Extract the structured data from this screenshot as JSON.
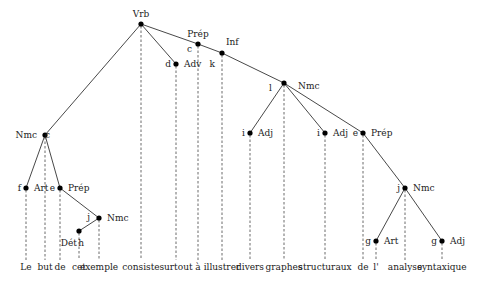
{
  "diagram": {
    "type": "dependency-tree",
    "word_baseline_y": 270,
    "nodes": [
      {
        "id": "vrb",
        "label": "Vrb",
        "tag": "",
        "x": 141,
        "y": 24,
        "label_pos": "top",
        "word": "consiste"
      },
      {
        "id": "adv",
        "label": "Adv",
        "tag": "d",
        "x": 176,
        "y": 64,
        "label_pos": "right",
        "word": "surtout"
      },
      {
        "id": "prep1",
        "label": "Prép",
        "tag": "c",
        "x": 198,
        "y": 44,
        "label_pos": "top",
        "word": "à"
      },
      {
        "id": "inf",
        "label": "Inf",
        "tag": "k",
        "x": 222,
        "y": 53,
        "label_pos": "topright",
        "word": "illustrer"
      },
      {
        "id": "nmc1",
        "label": "Nmc",
        "tag": "l",
        "x": 284,
        "y": 83,
        "label_pos": "right",
        "word": "graphes"
      },
      {
        "id": "adj1",
        "label": "Adj",
        "tag": "i",
        "x": 250,
        "y": 133,
        "label_pos": "right",
        "word": "divers"
      },
      {
        "id": "adj2",
        "label": "Adj",
        "tag": "i",
        "x": 325,
        "y": 133,
        "label_pos": "right",
        "word": "structuraux"
      },
      {
        "id": "prep2",
        "label": "Prép",
        "tag": "e",
        "x": 363,
        "y": 133,
        "label_pos": "right",
        "word": "de"
      },
      {
        "id": "nmc2",
        "label": "Nmc",
        "tag": "j",
        "x": 405,
        "y": 188,
        "label_pos": "right",
        "word": "analyse"
      },
      {
        "id": "art2",
        "label": "Art",
        "tag": "g",
        "x": 376,
        "y": 241,
        "label_pos": "right",
        "word": "l'"
      },
      {
        "id": "adj3",
        "label": "Adj",
        "tag": "g",
        "x": 442,
        "y": 241,
        "label_pos": "right",
        "word": "syntaxique"
      },
      {
        "id": "nmc0",
        "label": "Nmc",
        "tag": "c",
        "x": 45,
        "y": 135,
        "label_pos": "left",
        "word": "but"
      },
      {
        "id": "art1",
        "label": "Art",
        "tag": "f",
        "x": 26,
        "y": 188,
        "label_pos": "right",
        "word": "Le"
      },
      {
        "id": "prep0",
        "label": "Prép",
        "tag": "e",
        "x": 60,
        "y": 188,
        "label_pos": "right",
        "word": "de"
      },
      {
        "id": "nmc3",
        "label": "Nmc",
        "tag": "j",
        "x": 99,
        "y": 218,
        "label_pos": "right",
        "word": "exemple"
      },
      {
        "id": "det",
        "label": "Dét",
        "tag": "h",
        "x": 79,
        "y": 231,
        "label_pos": "below",
        "word": "cet"
      }
    ],
    "edges": [
      [
        "vrb",
        "nmc0"
      ],
      [
        "vrb",
        "adv"
      ],
      [
        "vrb",
        "prep1"
      ],
      [
        "prep1",
        "inf"
      ],
      [
        "inf",
        "nmc1"
      ],
      [
        "nmc1",
        "adj1"
      ],
      [
        "nmc1",
        "adj2"
      ],
      [
        "nmc1",
        "prep2"
      ],
      [
        "prep2",
        "nmc2"
      ],
      [
        "nmc2",
        "art2"
      ],
      [
        "nmc2",
        "adj3"
      ],
      [
        "nmc0",
        "art1"
      ],
      [
        "nmc0",
        "prep0"
      ],
      [
        "prep0",
        "nmc3"
      ],
      [
        "nmc3",
        "det"
      ]
    ],
    "words": [
      {
        "text": "Le",
        "x": 26
      },
      {
        "text": "but",
        "x": 45
      },
      {
        "text": "de",
        "x": 60
      },
      {
        "text": "cet",
        "x": 79
      },
      {
        "text": "exemple",
        "x": 99
      },
      {
        "text": "consiste",
        "x": 141
      },
      {
        "text": "surtout",
        "x": 176
      },
      {
        "text": "à",
        "x": 198
      },
      {
        "text": "illustrer",
        "x": 222
      },
      {
        "text": "divers",
        "x": 250
      },
      {
        "text": "graphes",
        "x": 284
      },
      {
        "text": "structuraux",
        "x": 325
      },
      {
        "text": "de",
        "x": 363
      },
      {
        "text": "l'",
        "x": 376
      },
      {
        "text": "analyse",
        "x": 405
      },
      {
        "text": "syntaxique",
        "x": 442
      }
    ]
  }
}
